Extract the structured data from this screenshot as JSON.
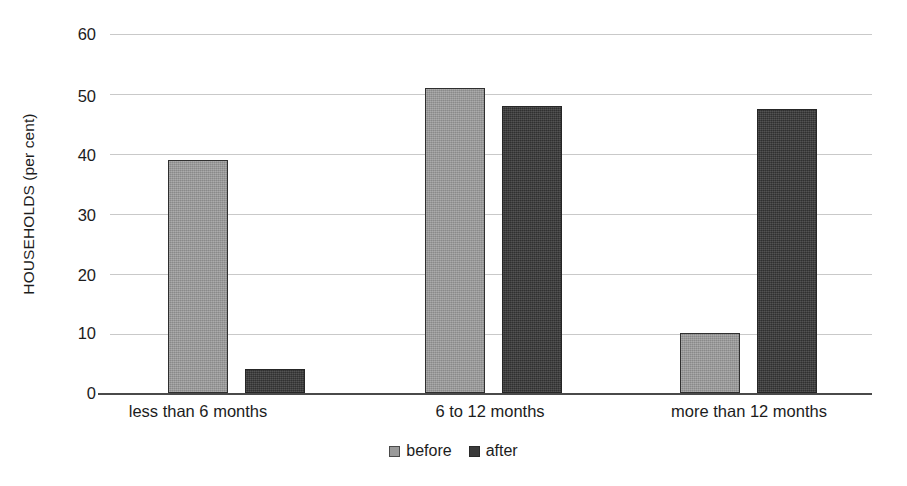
{
  "chart_data": {
    "type": "bar",
    "title": "",
    "xlabel": "",
    "ylabel": "HOUSEHOLDS (per cent)",
    "categories": [
      "less than 6 months",
      "6 to 12 months",
      "more than 12 months"
    ],
    "series": [
      {
        "name": "before",
        "values": [
          39,
          51,
          10
        ],
        "color": "#9a9a9a"
      },
      {
        "name": "after",
        "values": [
          4,
          48,
          47.5
        ],
        "color": "#3a3a3a"
      }
    ],
    "ylim": [
      0,
      60
    ],
    "ytick_labels": [
      "60",
      "50",
      "40",
      "30",
      "20",
      "10",
      "0"
    ],
    "ytick_values": [
      60,
      50,
      40,
      30,
      20,
      10,
      0
    ],
    "grid": true,
    "legend_position": "bottom-center",
    "legend_entries": [
      "before",
      "after"
    ]
  },
  "axis": {
    "y_title": "HOUSEHOLDS (per cent)"
  },
  "legend": {
    "before_label": "before",
    "after_label": "after"
  }
}
